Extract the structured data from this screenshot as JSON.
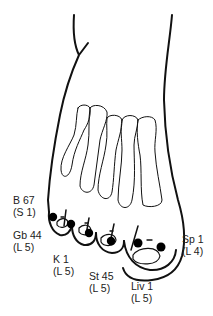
{
  "diagram": {
    "colors": {
      "outline": "#111111",
      "point": "#000000",
      "background": "#ffffff",
      "text": "#222222"
    },
    "points": [
      {
        "id": "b67",
        "name": "B 67",
        "meridian_ref": "(S 1)"
      },
      {
        "id": "gb44",
        "name": "Gb 44",
        "meridian_ref": "(L 5)"
      },
      {
        "id": "k1",
        "name": "K 1",
        "meridian_ref": "(L 5)"
      },
      {
        "id": "st45",
        "name": "St 45",
        "meridian_ref": "(L 5)"
      },
      {
        "id": "liv1",
        "name": "Liv 1",
        "meridian_ref": "(L 5)"
      },
      {
        "id": "sp1",
        "name": "Sp 1",
        "meridian_ref": "(L 4)"
      }
    ]
  }
}
